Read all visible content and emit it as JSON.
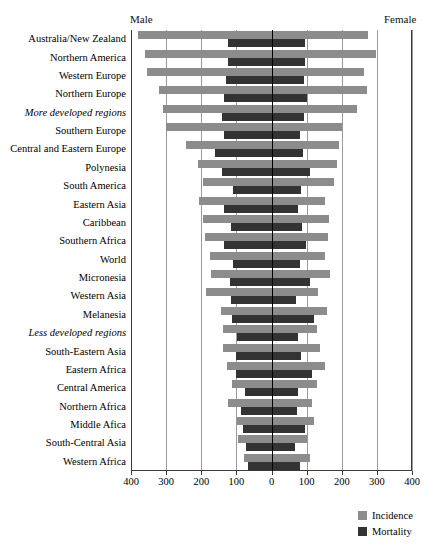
{
  "header": {
    "male_label": "Male",
    "female_label": "Female"
  },
  "legend": {
    "items": [
      {
        "label": "Incidence",
        "color": "#8c8c8c"
      },
      {
        "label": "Mortality",
        "color": "#333333"
      }
    ]
  },
  "axis": {
    "tick_labels": [
      "400",
      "300",
      "200",
      "100",
      "0",
      "100",
      "200",
      "300",
      "400"
    ],
    "tick_values": [
      -400,
      -300,
      -200,
      -100,
      0,
      100,
      200,
      300,
      400
    ],
    "min": -400,
    "max": 400
  },
  "chart_data": {
    "type": "bar",
    "title": "",
    "subtitle": "",
    "xlabel": "",
    "ylabel": "",
    "orientation": "horizontal",
    "layout": "population-pyramid / back-to-back bars",
    "grid": true,
    "legend_position": "bottom-right",
    "xlim": [
      -400,
      400
    ],
    "x_tick_labels": [
      "400",
      "300",
      "200",
      "100",
      "0",
      "100",
      "200",
      "300",
      "400"
    ],
    "side_labels": {
      "left": "Male",
      "right": "Female"
    },
    "series": [
      {
        "name": "Incidence",
        "color": "#8c8c8c"
      },
      {
        "name": "Mortality",
        "color": "#333333"
      }
    ],
    "categories": [
      "Australia/New Zealand",
      "Northern America",
      "Western Europe",
      "Northern Europe",
      "More developed regions",
      "Southern Europe",
      "Central and Eastern Europe",
      "Polynesia",
      "South America",
      "Eastern Asia",
      "Caribbean",
      "Southern Africa",
      "World",
      "Micronesia",
      "Western Asia",
      "Melanesia",
      "Less developed regions",
      "South-Eastern Asia",
      "Eastern Africa",
      "Central America",
      "Northern Africa",
      "Middle Afica",
      "South-Central Asia",
      "Western Africa"
    ],
    "categories_italic": [
      "More developed regions",
      "Less developed regions"
    ],
    "rows": [
      {
        "category": "Australia/New Zealand",
        "male_incidence": 380,
        "female_incidence": 275,
        "male_mortality": 124,
        "female_mortality": 96
      },
      {
        "category": "Northern America",
        "male_incidence": 360,
        "female_incidence": 297,
        "male_mortality": 124,
        "female_mortality": 96
      },
      {
        "category": "Western Europe",
        "male_incidence": 355,
        "female_incidence": 263,
        "male_mortality": 130,
        "female_mortality": 93
      },
      {
        "category": "Northern Europe",
        "male_incidence": 320,
        "female_incidence": 272,
        "male_mortality": 134,
        "female_mortality": 100
      },
      {
        "category": "More developed regions",
        "male_incidence": 310,
        "female_incidence": 243,
        "male_mortality": 140,
        "female_mortality": 92
      },
      {
        "category": "Southern Europe",
        "male_incidence": 300,
        "female_incidence": 200,
        "male_mortality": 134,
        "female_mortality": 80
      },
      {
        "category": "Central and Eastern Europe",
        "male_incidence": 242,
        "female_incidence": 193,
        "male_mortality": 160,
        "female_mortality": 90
      },
      {
        "category": "Polynesia",
        "male_incidence": 208,
        "female_incidence": 186,
        "male_mortality": 140,
        "female_mortality": 110
      },
      {
        "category": "South America",
        "male_incidence": 194,
        "female_incidence": 178,
        "male_mortality": 110,
        "female_mortality": 85
      },
      {
        "category": "Eastern Asia",
        "male_incidence": 207,
        "female_incidence": 152,
        "male_mortality": 134,
        "female_mortality": 75
      },
      {
        "category": "Caribbean",
        "male_incidence": 194,
        "female_incidence": 164,
        "male_mortality": 116,
        "female_mortality": 86
      },
      {
        "category": "Southern Africa",
        "male_incidence": 188,
        "female_incidence": 160,
        "male_mortality": 134,
        "female_mortality": 98
      },
      {
        "category": "World",
        "male_incidence": 174,
        "female_incidence": 152,
        "male_mortality": 110,
        "female_mortality": 80
      },
      {
        "category": "Micronesia",
        "male_incidence": 172,
        "female_incidence": 167,
        "male_mortality": 119,
        "female_mortality": 110
      },
      {
        "category": "Western Asia",
        "male_incidence": 186,
        "female_incidence": 132,
        "male_mortality": 115,
        "female_mortality": 70
      },
      {
        "category": "Melanesia",
        "male_incidence": 143,
        "female_incidence": 158,
        "male_mortality": 113,
        "female_mortality": 120
      },
      {
        "category": "Less developed regions",
        "male_incidence": 139,
        "female_incidence": 130,
        "male_mortality": 97,
        "female_mortality": 76
      },
      {
        "category": "South-Eastern Asia",
        "male_incidence": 137,
        "female_incidence": 138,
        "male_mortality": 100,
        "female_mortality": 83
      },
      {
        "category": "Eastern Africa",
        "male_incidence": 127,
        "female_incidence": 152,
        "male_mortality": 100,
        "female_mortality": 115
      },
      {
        "category": "Central America",
        "male_incidence": 112,
        "female_incidence": 130,
        "male_mortality": 76,
        "female_mortality": 76
      },
      {
        "category": "Northern Africa",
        "male_incidence": 123,
        "female_incidence": 116,
        "male_mortality": 86,
        "female_mortality": 73
      },
      {
        "category": "Middle Afica",
        "male_incidence": 98,
        "female_incidence": 120,
        "male_mortality": 80,
        "female_mortality": 95
      },
      {
        "category": "South-Central Asia",
        "male_incidence": 95,
        "female_incidence": 100,
        "male_mortality": 72,
        "female_mortality": 67
      },
      {
        "category": "Western Africa",
        "male_incidence": 79,
        "female_incidence": 110,
        "male_mortality": 67,
        "female_mortality": 82
      }
    ]
  }
}
